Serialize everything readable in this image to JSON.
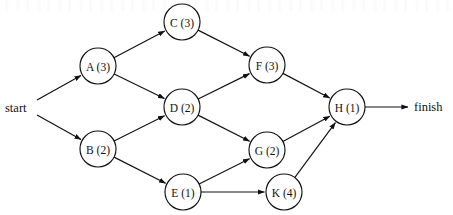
{
  "diagram": {
    "type": "directed-graph",
    "width": 453,
    "height": 215,
    "stroke_color": "#111111",
    "node_fill": "#ffffff",
    "node_radius": 18,
    "start_label": "start",
    "finish_label": "finish",
    "nodes": [
      {
        "id": "A",
        "label": "A (3)",
        "name": "A",
        "duration": 3,
        "cx": 98,
        "cy": 66
      },
      {
        "id": "B",
        "label": "B (2)",
        "name": "B",
        "duration": 2,
        "cx": 98,
        "cy": 149
      },
      {
        "id": "C",
        "label": "C (3)",
        "name": "C",
        "duration": 3,
        "cx": 182,
        "cy": 22
      },
      {
        "id": "D",
        "label": "D (2)",
        "name": "D",
        "duration": 2,
        "cx": 182,
        "cy": 107
      },
      {
        "id": "E",
        "label": "E (1)",
        "name": "E",
        "duration": 1,
        "cx": 183,
        "cy": 192
      },
      {
        "id": "F",
        "label": "F (3)",
        "name": "F",
        "duration": 3,
        "cx": 267,
        "cy": 65
      },
      {
        "id": "G",
        "label": "G (2)",
        "name": "G",
        "duration": 2,
        "cx": 267,
        "cy": 150
      },
      {
        "id": "H",
        "label": "H (1)",
        "name": "H",
        "duration": 1,
        "cx": 347,
        "cy": 107
      },
      {
        "id": "K",
        "label": "K (4)",
        "name": "K",
        "duration": 4,
        "cx": 284,
        "cy": 192
      }
    ],
    "edges": [
      {
        "from": "start",
        "to": "A",
        "arrow": true
      },
      {
        "from": "start",
        "to": "B",
        "arrow": true
      },
      {
        "from": "A",
        "to": "C",
        "arrow": true
      },
      {
        "from": "A",
        "to": "D",
        "arrow": true
      },
      {
        "from": "B",
        "to": "D",
        "arrow": true
      },
      {
        "from": "B",
        "to": "E",
        "arrow": true
      },
      {
        "from": "C",
        "to": "F",
        "arrow": true
      },
      {
        "from": "D",
        "to": "F",
        "arrow": true
      },
      {
        "from": "D",
        "to": "G",
        "arrow": true
      },
      {
        "from": "E",
        "to": "G",
        "arrow": true
      },
      {
        "from": "E",
        "to": "K",
        "arrow": true
      },
      {
        "from": "F",
        "to": "H",
        "arrow": true
      },
      {
        "from": "G",
        "to": "H",
        "arrow": true
      },
      {
        "from": "K",
        "to": "H",
        "arrow": true
      },
      {
        "from": "H",
        "to": "finish",
        "arrow": true
      }
    ],
    "start_anchor": {
      "x": 37,
      "y": 100,
      "x2": 37,
      "y2": 115
    },
    "start_text_pos": {
      "x": 5,
      "y": 108
    },
    "finish_text_pos": {
      "x": 414,
      "y": 107
    },
    "finish_arrow_end": {
      "x": 408,
      "y": 107
    }
  }
}
